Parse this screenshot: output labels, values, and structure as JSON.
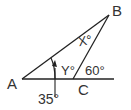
{
  "diagram": {
    "type": "geometry-triangle",
    "points": {
      "A": {
        "label": "A"
      },
      "B": {
        "label": "B"
      },
      "C": {
        "label": "C"
      }
    },
    "angles": {
      "at_A": "35°",
      "at_B": "X°",
      "interior_C": "Y°",
      "exterior_C": "60°"
    },
    "stroke_color": "#222222"
  }
}
